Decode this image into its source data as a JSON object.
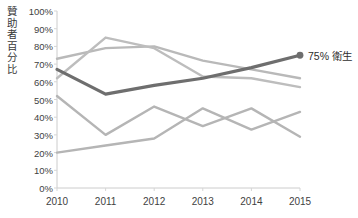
{
  "chart_data": {
    "type": "line",
    "title": "",
    "xlabel": "",
    "ylabel": "贊助者百分比",
    "x": [
      2010,
      2011,
      2012,
      2013,
      2014,
      2015
    ],
    "categories": [
      "2010",
      "2011",
      "2012",
      "2013",
      "2014",
      "2015"
    ],
    "xtick_labels": [
      "2010",
      "2011",
      "2012",
      "2013",
      "2014",
      "2015"
    ],
    "ytick_labels": [
      "0%",
      "10%",
      "20%",
      "30%",
      "40%",
      "50%",
      "60%",
      "70%",
      "80%",
      "90%",
      "100%"
    ],
    "ytick_values": [
      0,
      10,
      20,
      30,
      40,
      50,
      60,
      70,
      80,
      90,
      100
    ],
    "ylim": [
      0,
      100
    ],
    "xlim": [
      2010,
      2015
    ],
    "grid": false,
    "legend": "none",
    "value_suffix": "%",
    "series": [
      {
        "name": "衛生",
        "highlight": true,
        "color": "#6e6e6e",
        "width": 3.2,
        "values": [
          67,
          53,
          58,
          62,
          68,
          75
        ],
        "end_marker": true
      },
      {
        "name": "series-2",
        "highlight": false,
        "color": "#b9b9b9",
        "width": 2.4,
        "values": [
          73,
          79,
          80,
          72,
          67,
          62
        ],
        "end_marker": false
      },
      {
        "name": "series-3",
        "highlight": false,
        "color": "#bdbdbd",
        "width": 2.4,
        "values": [
          62,
          85,
          79,
          63,
          62,
          57
        ],
        "end_marker": false
      },
      {
        "name": "series-4",
        "highlight": false,
        "color": "#b5b5b5",
        "width": 2.4,
        "values": [
          52,
          30,
          46,
          35,
          45,
          29
        ],
        "end_marker": false
      },
      {
        "name": "series-5",
        "highlight": false,
        "color": "#b5b5b5",
        "width": 2.4,
        "values": [
          20,
          24,
          28,
          45,
          33,
          43
        ],
        "end_marker": false
      }
    ],
    "annotations": [
      {
        "name": "end-value-label",
        "text": "75% 衛生",
        "value": 75,
        "series": "衛生"
      }
    ]
  },
  "axis": {
    "line_color": "#cccccc",
    "tick_color": "#d5d5d5",
    "label_color": "#3f3f3f"
  },
  "end_label": {
    "text": "75% 衛生"
  }
}
